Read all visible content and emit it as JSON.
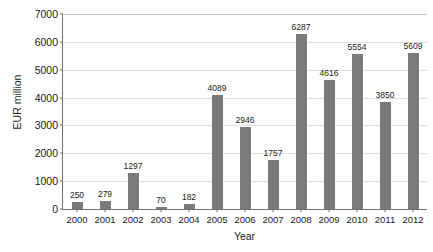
{
  "chart_data": {
    "type": "bar",
    "title": "",
    "xlabel": "Year",
    "ylabel": "EUR million",
    "categories": [
      "2000",
      "2001",
      "2002",
      "2003",
      "2004",
      "2005",
      "2006",
      "2007",
      "2008",
      "2009",
      "2010",
      "2011",
      "2012"
    ],
    "values": [
      250,
      279,
      1297,
      70,
      182,
      4089,
      2946,
      1757,
      6287,
      4616,
      5554,
      3850,
      5609
    ],
    "ylim": [
      0,
      7000
    ],
    "yticks": [
      0,
      1000,
      2000,
      3000,
      4000,
      5000,
      6000,
      7000
    ],
    "ytick_labels": [
      "0",
      "1000",
      "2000",
      "3000",
      "4000",
      "5000",
      "6000",
      "7000"
    ],
    "grid": true,
    "legend": false,
    "bar_color": "#7a7a7a",
    "gridline_color": "#dddddd",
    "axis_color": "#6f6f6f",
    "data_labels": [
      "250",
      "279",
      "1297",
      "70",
      "182",
      "4089",
      "2946",
      "1757",
      "6287",
      "4616",
      "5554",
      "3850",
      "5609"
    ]
  }
}
